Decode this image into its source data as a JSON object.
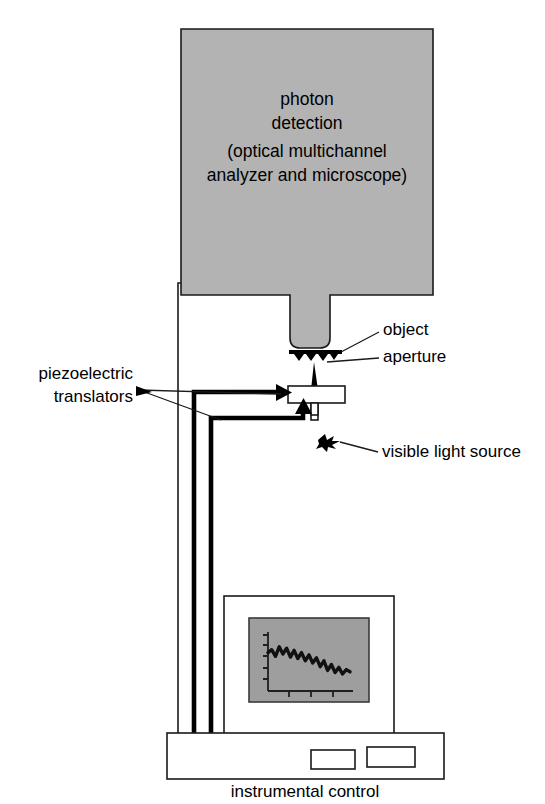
{
  "figure": {
    "background_color": "#ffffff",
    "ink_color": "#1a1a1a",
    "body_fill_color": "#b3b3b3",
    "screen_fill_color": "#9e9e9e"
  },
  "detector": {
    "line1": "photon",
    "line2": "detection",
    "line3": "(optical multichannel",
    "line4": "analyzer and microscope)"
  },
  "labels": {
    "object": "object",
    "aperture": "aperture",
    "piezo_line1": "piezoelectric",
    "piezo_line2": "translators",
    "light_source": "visible light source",
    "instrumental_control": "instrumental control"
  },
  "icons": {
    "light_source_glyph": "starburst-icon",
    "object_glyph": "sample-bar-icon",
    "aperture_glyph": "tapered-probe-icon"
  },
  "chart_data": {
    "type": "line",
    "title": "",
    "xlabel": "",
    "ylabel": "",
    "x": [
      0,
      1,
      2,
      3,
      4,
      5,
      6,
      7,
      8,
      9,
      10,
      11,
      12,
      13,
      14,
      15,
      16,
      17,
      18,
      19,
      20,
      21,
      22
    ],
    "values": [
      52,
      56,
      47,
      60,
      50,
      58,
      46,
      55,
      44,
      52,
      41,
      49,
      38,
      45,
      33,
      41,
      28,
      36,
      25,
      32,
      23,
      29,
      26
    ],
    "xlim": [
      0,
      22
    ],
    "ylim": [
      0,
      80
    ],
    "grid": false,
    "legend": false,
    "y_ticks": 4,
    "x_ticks": 3
  }
}
